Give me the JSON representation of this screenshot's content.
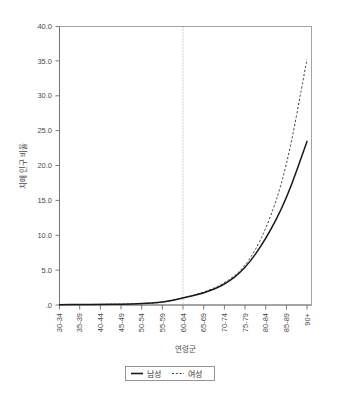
{
  "chart_data": {
    "type": "line",
    "title": "",
    "subtitle": "",
    "xlabel": "연령군",
    "ylabel": "치매 인구 비율",
    "categories": [
      "30-34",
      "35-39",
      "40-44",
      "45-49",
      "50-54",
      "55-59",
      "60-64",
      "65-69",
      "70-74",
      "75-79",
      "80-84",
      "85-89",
      "90+"
    ],
    "series": [
      {
        "name": "남성",
        "style": "solid",
        "color": "#1a1a1a",
        "values": [
          0.05,
          0.06,
          0.08,
          0.12,
          0.2,
          0.35,
          1.0,
          1.7,
          2.9,
          5.2,
          9.4,
          15.1,
          23.5
        ]
      },
      {
        "name": "여성",
        "style": "dashed",
        "color": "#3c3c3c",
        "values": [
          0.05,
          0.06,
          0.08,
          0.12,
          0.2,
          0.35,
          1.0,
          1.8,
          3.1,
          5.4,
          10.6,
          19.4,
          35.3
        ]
      }
    ],
    "ylim": [
      0.0,
      40.0
    ],
    "yticks": [
      ".0",
      "5.0",
      "10.0",
      "15.0",
      "20.0",
      "25.0",
      "30.0",
      "35.0",
      "40.0"
    ],
    "ytick_values": [
      0,
      5,
      10,
      15,
      20,
      25,
      30,
      35,
      40
    ],
    "grid": false,
    "legend_position": "bottom",
    "annotations": [
      {
        "type": "vertical-reference-line",
        "at_category": "60-64",
        "style": "dotted",
        "label": ""
      }
    ]
  },
  "legend": {
    "entries": [
      {
        "label": "남성",
        "style": "solid"
      },
      {
        "label": "여성",
        "style": "dashed"
      }
    ]
  },
  "axes": {
    "x_title": "연령군",
    "y_title": "치매 인구 비율"
  }
}
